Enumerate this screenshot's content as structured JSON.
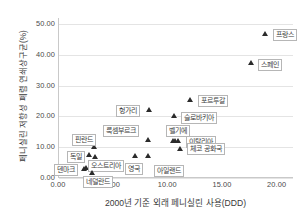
{
  "chart_data": {
    "type": "scatter",
    "title": "",
    "xlabel": "2000년 기준 외래 페니실린 사용(DDD)",
    "ylabel": "페니실린 저항성 폐렴 연쇄상구균(%)",
    "xlim": [
      0.0,
      21.5
    ],
    "ylim": [
      0.0,
      52.0
    ],
    "xticks": [
      "0.00",
      "5.00",
      "10.00",
      "15.00",
      "20.00"
    ],
    "xtick_values": [
      0,
      5,
      10,
      15,
      20
    ],
    "yticks": [
      "0.00",
      "10.00",
      "20.00",
      "30.00",
      "40.00",
      "50.00"
    ],
    "ytick_values": [
      0,
      10,
      20,
      30,
      40,
      50
    ],
    "grid": "horizontal",
    "legend": "none",
    "marker": "triangle",
    "marker_color": "#2b2b2b",
    "points": [
      {
        "label": "프랑스",
        "x": 18.9,
        "y": 47.0,
        "lx": 8,
        "ly": -4
      },
      {
        "label": "스페인",
        "x": 17.7,
        "y": 37.4,
        "lx": 7,
        "ly": -4
      },
      {
        "label": "포르투갈",
        "x": 12.1,
        "y": 25.6,
        "lx": 8,
        "ly": -4
      },
      {
        "label": "헝가리",
        "x": 8.3,
        "y": 22.3,
        "lx": -33,
        "ly": -4
      },
      {
        "label": "슬로바키아",
        "x": 10.6,
        "y": 20.2,
        "lx": 7,
        "ly": -4
      },
      {
        "label": "룩셈부르크",
        "x": 8.2,
        "y": 12.4,
        "lx": -45,
        "ly": -15
      },
      {
        "label": "벨기에",
        "x": 10.5,
        "y": 12.3,
        "lx": -7,
        "ly": -15
      },
      {
        "label": "이탈리아",
        "x": 11.0,
        "y": 12.2,
        "lx": 8,
        "ly": -4
      },
      {
        "label": "체코 공화국",
        "x": 11.2,
        "y": 9.6,
        "lx": 7,
        "ly": -5
      },
      {
        "label": "핀란드",
        "x": 3.3,
        "y": 10.2,
        "lx": -22,
        "ly": -13
      },
      {
        "label": "독일",
        "x": 2.8,
        "y": 7.6,
        "lx": -22,
        "ly": -4
      },
      {
        "label": "오스트리아",
        "x": 3.4,
        "y": 6.9,
        "lx": -7,
        "ly": 3
      },
      {
        "label": "영국",
        "x": 7.0,
        "y": 7.4,
        "lx": -10,
        "ly": 8
      },
      {
        "label": "아일랜드",
        "x": 8.2,
        "y": 7.4,
        "lx": 6,
        "ly": 10
      },
      {
        "label": "덴마크",
        "x": 2.4,
        "y": 3.2,
        "lx": -30,
        "ly": -4
      },
      {
        "label": "네덜란드",
        "x": 3.1,
        "y": 1.9,
        "lx": -9,
        "ly": 4
      }
    ],
    "extra_markers": [
      {
        "x": 2.6,
        "y": 3.3
      },
      {
        "x": 2.9,
        "y": 3.4
      },
      {
        "x": 3.2,
        "y": 3.3
      },
      {
        "x": 3.5,
        "y": 3.2
      },
      {
        "x": 10.7,
        "y": 12.2
      }
    ]
  }
}
